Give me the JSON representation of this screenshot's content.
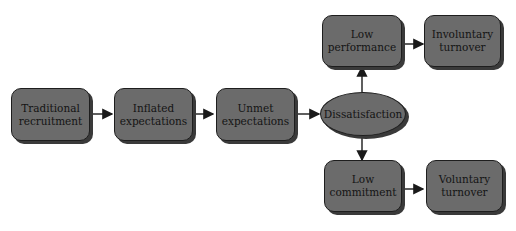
{
  "diagram": {
    "type": "flowchart",
    "colors": {
      "node_fill": "#6b6b6b",
      "node_border": "#1e1e1e",
      "shadow": "#3a3a3a",
      "arrow": "#1a1a1a"
    },
    "nodes": [
      {
        "id": "traditional",
        "label": "Traditional recruitment",
        "line1": "Traditional",
        "line2": "recruitment",
        "shape": "rounded-rect"
      },
      {
        "id": "inflated",
        "label": "Inflated expectations",
        "line1": "Inflated",
        "line2": "expectations",
        "shape": "rounded-rect"
      },
      {
        "id": "unmet",
        "label": "Unmet expectations",
        "line1": "Unmet",
        "line2": "expectations",
        "shape": "rounded-rect"
      },
      {
        "id": "dissatisfaction",
        "label": "Dissatisfaction",
        "line1": "Dissatisfaction",
        "shape": "ellipse"
      },
      {
        "id": "low_performance",
        "label": "Low performance",
        "line1": "Low",
        "line2": "performance",
        "shape": "rounded-rect"
      },
      {
        "id": "involuntary",
        "label": "Involuntary turnover",
        "line1": "Involuntary",
        "line2": "turnover",
        "shape": "rounded-rect"
      },
      {
        "id": "low_commitment",
        "label": "Low commitment",
        "line1": "Low",
        "line2": "commitment",
        "shape": "rounded-rect"
      },
      {
        "id": "voluntary",
        "label": "Voluntary turnover",
        "line1": "Voluntary",
        "line2": "turnover",
        "shape": "rounded-rect"
      }
    ],
    "edges": [
      {
        "from": "traditional",
        "to": "inflated"
      },
      {
        "from": "inflated",
        "to": "unmet"
      },
      {
        "from": "unmet",
        "to": "dissatisfaction"
      },
      {
        "from": "dissatisfaction",
        "to": "low_performance"
      },
      {
        "from": "dissatisfaction",
        "to": "low_commitment"
      },
      {
        "from": "low_performance",
        "to": "involuntary"
      },
      {
        "from": "low_commitment",
        "to": "voluntary"
      }
    ]
  }
}
